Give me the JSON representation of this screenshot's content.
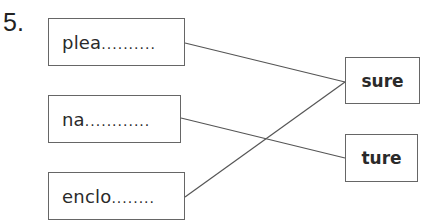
{
  "question": {
    "number": "5."
  },
  "left_boxes": [
    {
      "stem": "plea",
      "dots": "..........",
      "box": {
        "x": 48,
        "y": 18,
        "w": 137,
        "h": 48
      }
    },
    {
      "stem": "na",
      "dots": "............",
      "box": {
        "x": 48,
        "y": 95,
        "w": 133,
        "h": 48
      }
    },
    {
      "stem": "enclo",
      "dots": "........",
      "box": {
        "x": 48,
        "y": 172,
        "w": 137,
        "h": 48
      }
    }
  ],
  "right_boxes": [
    {
      "label": "sure",
      "box": {
        "x": 345,
        "y": 57,
        "w": 75,
        "h": 47
      }
    },
    {
      "label": "ture",
      "box": {
        "x": 345,
        "y": 134,
        "w": 73,
        "h": 48
      }
    }
  ],
  "connections": [
    {
      "from": "plea",
      "to": "sure"
    },
    {
      "from": "na",
      "to": "ture"
    },
    {
      "from": "enclo",
      "to": "sure"
    }
  ],
  "colors": {
    "line": "#555555",
    "border": "#666666",
    "text": "#2a2a2a"
  }
}
